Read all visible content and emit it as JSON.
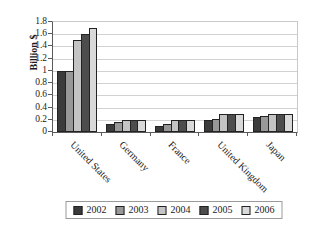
{
  "chart_data": {
    "type": "bar",
    "title": "",
    "ylabel": "Billion $",
    "xlabel": "",
    "ylim": [
      0,
      1.8
    ],
    "ytick_step": 0.2,
    "yticks": [
      "0",
      "0.2",
      "0.4",
      "0.6",
      "0.8",
      "1",
      "1.2",
      "1.4",
      "1.6",
      "1.8"
    ],
    "categories": [
      "United States",
      "Germany",
      "France",
      "United Kingdom",
      "Japan"
    ],
    "series": [
      {
        "name": "2002",
        "color": "#3b3b3b",
        "values": [
          1.0,
          0.13,
          0.1,
          0.2,
          0.25
        ]
      },
      {
        "name": "2003",
        "color": "#989898",
        "values": [
          1.0,
          0.17,
          0.13,
          0.22,
          0.27
        ]
      },
      {
        "name": "2004",
        "color": "#c4c4c4",
        "values": [
          1.5,
          0.2,
          0.2,
          0.3,
          0.3
        ]
      },
      {
        "name": "2005",
        "color": "#4d4d4d",
        "values": [
          1.6,
          0.2,
          0.2,
          0.3,
          0.3
        ]
      },
      {
        "name": "2006",
        "color": "#d9d9d9",
        "values": [
          1.7,
          0.2,
          0.2,
          0.3,
          0.3
        ]
      }
    ],
    "grid": true,
    "legend_position": "bottom"
  },
  "colors": {
    "background": "#ffffff",
    "gridline": "#d2d2d2",
    "axis": "#5a5a5a",
    "plot_border": "#c9c9c9",
    "bar_outline": "#232323",
    "legend_border": "#9a9a9a",
    "text": "#1a1a1a"
  }
}
